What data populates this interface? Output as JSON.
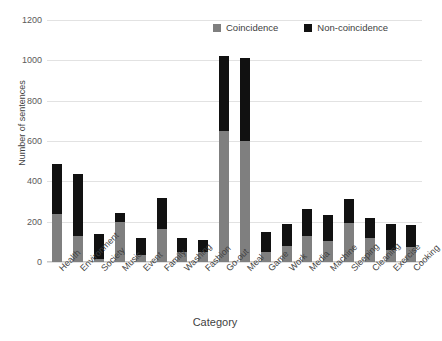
{
  "chart_data": {
    "type": "bar",
    "stacked": true,
    "title": "",
    "xlabel": "Category",
    "ylabel": "Number of sentences",
    "ylim": [
      0,
      1200
    ],
    "yticks": [
      0,
      200,
      400,
      600,
      800,
      1000,
      1200
    ],
    "grid": true,
    "legend_position": "top-right",
    "categories": [
      "Health",
      "Environment",
      "Society",
      "Music",
      "Event",
      "Family",
      "Washing",
      "Fashion",
      "Go-out",
      "Meal",
      "Game",
      "Work",
      "Media",
      "Machine",
      "Sleeping",
      "Cleaning",
      "Exercise",
      "Cooking"
    ],
    "series": [
      {
        "name": "Coincidence",
        "color": "#7f7f7f",
        "values": [
          238,
          128,
          15,
          198,
          35,
          163,
          50,
          50,
          650,
          600,
          50,
          80,
          130,
          105,
          195,
          120,
          60,
          75
        ]
      },
      {
        "name": "Non-coincidence",
        "color": "#111111",
        "values": [
          247,
          307,
          125,
          45,
          85,
          155,
          70,
          60,
          370,
          410,
          100,
          110,
          135,
          128,
          120,
          100,
          130,
          110
        ]
      }
    ],
    "totals": [
      485,
      435,
      140,
      243,
      120,
      318,
      120,
      110,
      1020,
      1010,
      150,
      190,
      265,
      233,
      315,
      220,
      190,
      185
    ]
  },
  "legend": {
    "items": [
      {
        "label": "Coincidence",
        "color": "#7f7f7f"
      },
      {
        "label": "Non-coincidence",
        "color": "#111111"
      }
    ]
  },
  "axes": {
    "y_title": "Number of sentences",
    "x_title": "Category",
    "y_tick_labels": [
      "1200",
      "1000",
      "800",
      "600",
      "400",
      "200",
      "0"
    ]
  }
}
